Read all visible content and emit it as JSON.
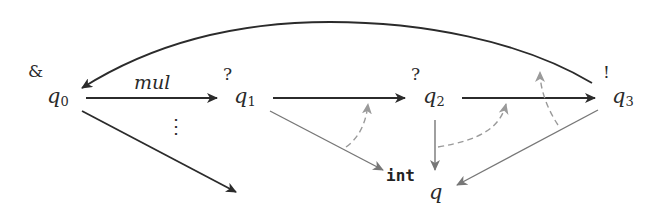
{
  "diagram": {
    "nodes": [
      {
        "id": "q0",
        "base": "q",
        "sub": "0",
        "polarity": "&"
      },
      {
        "id": "q1",
        "base": "q",
        "sub": "1",
        "polarity": "?"
      },
      {
        "id": "q2",
        "base": "q",
        "sub": "2",
        "polarity": "?"
      },
      {
        "id": "q3",
        "base": "q",
        "sub": "3",
        "polarity": "!"
      },
      {
        "id": "q",
        "base": "q",
        "sub": "",
        "polarity": "int"
      }
    ],
    "edges": [
      {
        "from": "q0",
        "to": "q1",
        "label": "mul",
        "style": "solid-dark"
      },
      {
        "from": "q0",
        "to": "offscreen",
        "label": "",
        "style": "solid-dark"
      },
      {
        "from": "q1",
        "to": "q2",
        "label": "",
        "style": "solid-dark"
      },
      {
        "from": "q2",
        "to": "q3",
        "label": "",
        "style": "solid-dark"
      },
      {
        "from": "q3",
        "to": "q0",
        "label": "",
        "style": "solid-dark-curved"
      },
      {
        "from": "q1",
        "to": "q",
        "label": "",
        "style": "solid-gray"
      },
      {
        "from": "q2",
        "to": "q",
        "label": "",
        "style": "solid-gray"
      },
      {
        "from": "q3",
        "to": "q",
        "label": "",
        "style": "solid-gray"
      },
      {
        "from": "q",
        "to": "q1-q2-edge",
        "label": "",
        "style": "dashed-gray"
      },
      {
        "from": "q",
        "to": "q2-q3-edge",
        "label": "",
        "style": "dashed-gray"
      },
      {
        "from": "q3-q-edge",
        "to": "q3-q0-edge",
        "label": "",
        "style": "dashed-gray"
      }
    ],
    "ellipsis": "⋮",
    "colors": {
      "dark": "#2b2b2b",
      "gray": "#777777",
      "dashed": "#9a9a9a"
    }
  }
}
